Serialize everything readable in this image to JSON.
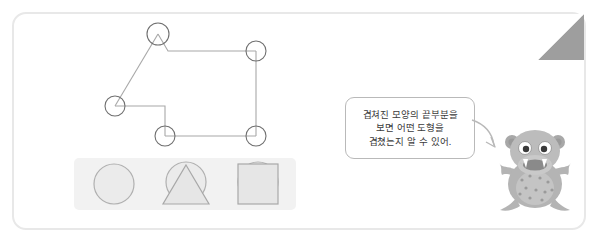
{
  "page": {
    "title": "겹쳐진 도형 찾기 활동 카드",
    "background_color": "#ffffff",
    "card_border_color": "#e8e8e8",
    "fold_color": "#9e9e9e"
  },
  "diagram": {
    "name": "overlapping-shapes-outline",
    "line_color": "#a8a8a8",
    "marker_count": 5,
    "markers": [
      {
        "id": "marker-top-apex",
        "label": "삼각형 꼭짓점",
        "cx": 158,
        "cy": 34,
        "r": 11
      },
      {
        "id": "marker-right-top-corner",
        "label": "사각형 꼭짓점",
        "cx": 256,
        "cy": 52,
        "r": 10
      },
      {
        "id": "marker-left-vertex",
        "label": "삼각형 꼭짓점",
        "cx": 115,
        "cy": 106,
        "r": 10
      },
      {
        "id": "marker-bottom-left-corner",
        "label": "사각형 꼭짓점",
        "cx": 165,
        "cy": 136,
        "r": 10
      },
      {
        "id": "marker-bottom-right-corner",
        "label": "사각형 꼭짓점",
        "cx": 256,
        "cy": 136,
        "r": 10
      }
    ]
  },
  "shapes_strip": {
    "name": "shape-option-strip",
    "background_color": "#f2f2f2",
    "items": [
      {
        "id": "shape-circle",
        "label": "원",
        "fill": "#ebebeb",
        "stroke": "#b0b0b0"
      },
      {
        "id": "shape-circle-triangle",
        "label": "원과 삼각형",
        "fill": "#ebebeb",
        "stroke": "#b0b0b0"
      },
      {
        "id": "shape-circle-square",
        "label": "원과 사각형",
        "fill": "#ebebeb",
        "stroke": "#b0b0b0"
      }
    ]
  },
  "speech_bubble": {
    "name": "speech-bubble",
    "border_color": "#b9b9b9",
    "text_color": "#3b3b3b",
    "lines": [
      "겹쳐진 모양의 끝부분을",
      "보면 어떤 도형을",
      "겹쳤는지 알 수 있어."
    ],
    "full_text": "겹쳐진 모양의 끝부분을 보면 어떤 도형을 겹쳤는지 알 수 있어."
  },
  "mascot": {
    "name": "hippo-monster-character",
    "label": "회색 하마 캐릭터",
    "body_color": "#b4b4b4",
    "belly_color": "#c9c9c9",
    "spot_color": "#9a9a9a",
    "mouth_color": "#8a8a8a",
    "eye_color": "#3a3a3a"
  }
}
